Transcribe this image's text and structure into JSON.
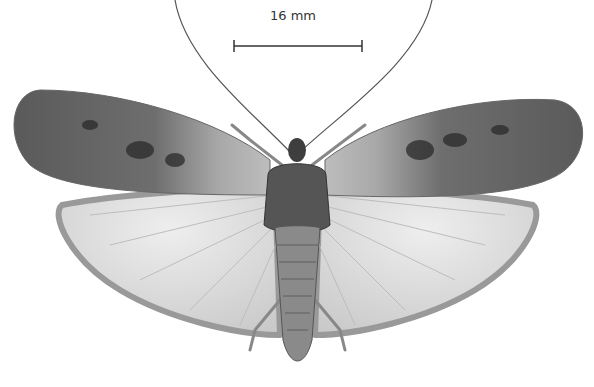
{
  "figure": {
    "scale_bar": {
      "label": "16 mm"
    },
    "colors": {
      "background": "#ffffff",
      "forewing_dark": "#4a4a4a",
      "hindwing_light": "#d8d8d8",
      "body": "#6a6a6a"
    }
  }
}
